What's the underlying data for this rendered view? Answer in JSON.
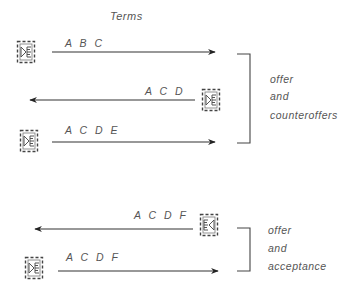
{
  "title": "Terms",
  "colors": {
    "line": "#333333",
    "text": "#555555",
    "icon": "#555555"
  },
  "groups": [
    {
      "name": "offer-and-counteroffers",
      "caption": [
        "offer",
        "and",
        "counteroffers"
      ],
      "messages": [
        {
          "direction": "right",
          "terms": "A B C",
          "icon": "document-send-icon"
        },
        {
          "direction": "left",
          "terms": "A C D",
          "icon": "document-send-icon"
        },
        {
          "direction": "right",
          "terms": "A C D E",
          "icon": "document-send-icon"
        }
      ]
    },
    {
      "name": "offer-and-acceptance",
      "caption": [
        "offer",
        "and",
        "acceptance"
      ],
      "messages": [
        {
          "direction": "left",
          "terms": "A C D F",
          "icon": "document-receive-icon"
        },
        {
          "direction": "right",
          "terms": "A C D F",
          "icon": "document-send-icon"
        }
      ]
    }
  ]
}
